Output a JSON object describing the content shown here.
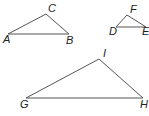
{
  "figure": {
    "stroke_color": "#555555",
    "label_color": "#222222",
    "triangles": [
      {
        "name": "ABC",
        "vertices": {
          "A": {
            "label": "A",
            "x": 8,
            "y": 34,
            "lx": 3,
            "ly": 43
          },
          "B": {
            "label": "B",
            "x": 69,
            "y": 34,
            "lx": 66,
            "ly": 44
          },
          "C": {
            "label": "C",
            "x": 46,
            "y": 14,
            "lx": 48,
            "ly": 12
          }
        }
      },
      {
        "name": "DEF",
        "vertices": {
          "D": {
            "label": "D",
            "x": 116,
            "y": 27,
            "lx": 109,
            "ly": 35
          },
          "E": {
            "label": "E",
            "x": 146,
            "y": 27,
            "lx": 142,
            "ly": 35
          },
          "F": {
            "label": "F",
            "x": 127,
            "y": 15,
            "lx": 130,
            "ly": 13
          }
        }
      },
      {
        "name": "GHI",
        "vertices": {
          "G": {
            "label": "G",
            "x": 26,
            "y": 98,
            "lx": 20,
            "ly": 108
          },
          "H": {
            "label": "H",
            "x": 143,
            "y": 98,
            "lx": 140,
            "ly": 108
          },
          "I": {
            "label": "I",
            "x": 99,
            "y": 59,
            "lx": 103,
            "ly": 57
          }
        }
      }
    ]
  }
}
